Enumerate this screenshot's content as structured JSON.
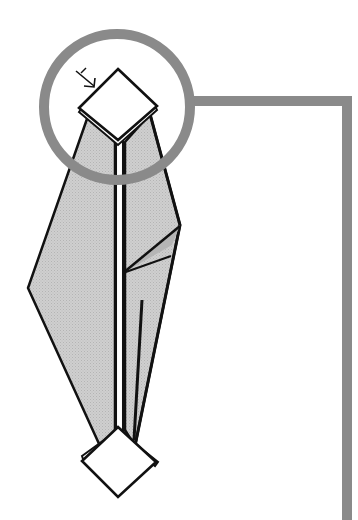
{
  "diagram": {
    "colors": {
      "paper": "#c8c8c8",
      "outline": "#111111",
      "tip": "#ffffff",
      "callout": "#888888",
      "background": "#ffffff"
    },
    "elements": {
      "fold_arrow": "fold-direction-arrow",
      "top_tip": "top-square-tip",
      "bottom_tip": "bottom-square-tip",
      "callout_circle": "magnify-callout-circle",
      "connector": "callout-connector-line"
    }
  }
}
